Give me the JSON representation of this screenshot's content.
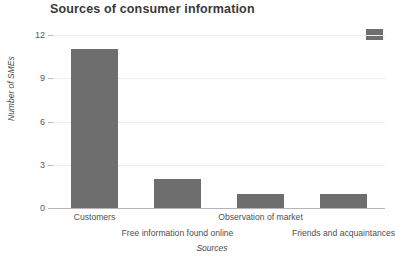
{
  "chart_data": {
    "type": "bar",
    "title": "Sources of consumer information",
    "xlabel": "Sources",
    "ylabel": "Number of SMEs",
    "categories": [
      "Customers",
      "Free information found online",
      "Observation of market",
      "Friends and acquaintances"
    ],
    "values": [
      11,
      2,
      1,
      1
    ],
    "ylim": [
      0,
      12
    ],
    "yticks": [
      0,
      3,
      6,
      9,
      12
    ],
    "ytick_labels": [
      "0",
      "3",
      "6",
      "9",
      "12"
    ],
    "grid": true,
    "legend_position": "top-right",
    "series": [
      {
        "name": "Number of SMEs",
        "values": [
          11,
          2,
          1,
          1
        ],
        "color": "#6e6e6e"
      }
    ],
    "colors": {
      "bar": "#6e6e6e",
      "gridline": "#ededed",
      "axis": "#b4b4b4",
      "title_text": "#3a3a3a",
      "tick_text": "#4f4f4f",
      "background": "#ffffff"
    }
  }
}
